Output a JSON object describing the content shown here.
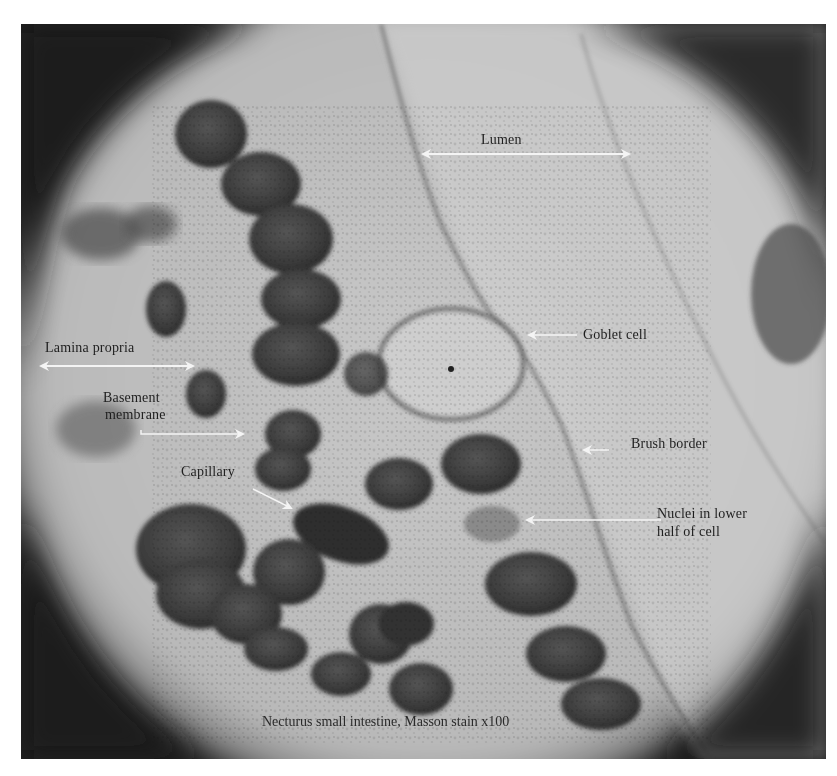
{
  "figure": {
    "caption": "Necturus small intestine, Masson stain   x100",
    "colors": {
      "background": "#ffffff",
      "vignette": "#1c1c1c",
      "field_light": "#c9c9c9",
      "lumen": "#d4d4d4",
      "nucleus": "#3f3f3f",
      "arrow": "#f4f4f4",
      "label_text": "#1e1e1e"
    },
    "labels": {
      "lumen": "Lumen",
      "lamina_propria": "Lamina propria",
      "basement_membrane_line1": "Basement",
      "basement_membrane_line2": "membrane",
      "goblet_cell": "Goblet cell",
      "brush_border": "Brush border",
      "capillary": "Capillary",
      "nuclei_line1": "Nuclei in lower",
      "nuclei_line2": "half of cell"
    }
  }
}
